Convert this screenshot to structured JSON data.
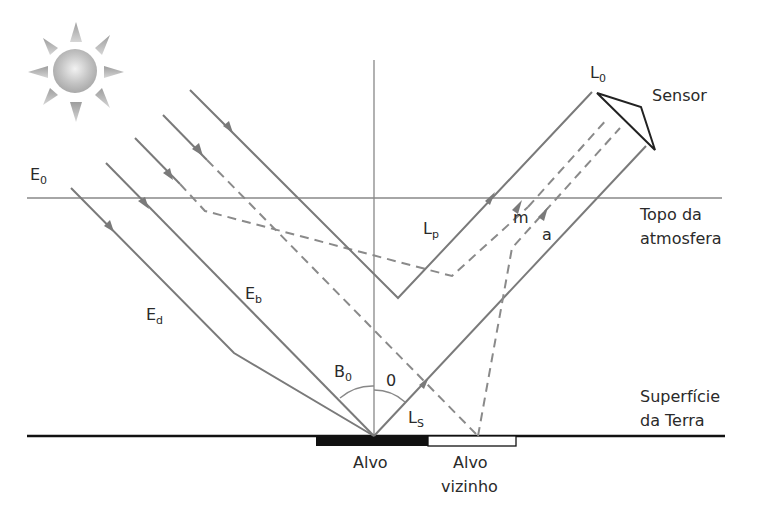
{
  "diagram": {
    "labels": {
      "sensor": "Sensor",
      "l0": "L",
      "l0_sub": "0",
      "e0": "E",
      "e0_sub": "0",
      "ed": "E",
      "ed_sub": "d",
      "eb": "E",
      "eb_sub": "b",
      "lp": "L",
      "lp_sub": "p",
      "ls": "L",
      "ls_sub": "S",
      "m": "m",
      "a": "a",
      "b0": "B",
      "b0_sub": "0",
      "theta": "0",
      "topo_line1": "Topo da",
      "topo_line2": "atmosfera",
      "superficie_line1": "Superfície",
      "superficie_line2": "da Terra",
      "alvo": "Alvo",
      "alvo_vizinho_line1": "Alvo",
      "alvo_vizinho_line2": "vizinho"
    },
    "colors": {
      "ray": "#7a7a7a",
      "ground": "#111111",
      "target": "#111111",
      "neighbor_target": "#ffffff",
      "sun": "#bdbdbd"
    }
  }
}
